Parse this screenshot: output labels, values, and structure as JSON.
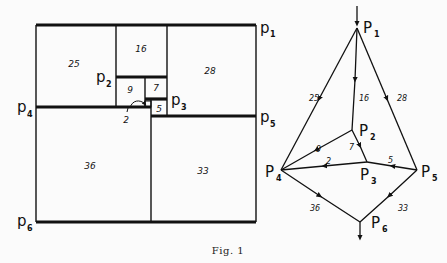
{
  "figure": {
    "caption": "Fig. 1"
  },
  "rectangle_dissection": {
    "squares": [
      {
        "id": "sq25",
        "label": "25"
      },
      {
        "id": "sq16",
        "label": "16"
      },
      {
        "id": "sq28",
        "label": "28"
      },
      {
        "id": "sq9",
        "label": "9"
      },
      {
        "id": "sq7",
        "label": "7"
      },
      {
        "id": "sq5",
        "label": "5"
      },
      {
        "id": "sq2",
        "label": "2"
      },
      {
        "id": "sq36",
        "label": "36"
      },
      {
        "id": "sq33",
        "label": "33"
      }
    ],
    "terminals": [
      {
        "id": "p1",
        "base": "p",
        "sub": "1"
      },
      {
        "id": "p2",
        "base": "p",
        "sub": "2"
      },
      {
        "id": "p3",
        "base": "p",
        "sub": "3"
      },
      {
        "id": "p4",
        "base": "p",
        "sub": "4"
      },
      {
        "id": "p5",
        "base": "p",
        "sub": "5"
      },
      {
        "id": "p6",
        "base": "p",
        "sub": "6"
      }
    ]
  },
  "network_graph": {
    "nodes": [
      {
        "id": "P1",
        "base": "P",
        "sub": "1"
      },
      {
        "id": "P2",
        "base": "P",
        "sub": "2"
      },
      {
        "id": "P3",
        "base": "P",
        "sub": "3"
      },
      {
        "id": "P4",
        "base": "P",
        "sub": "4"
      },
      {
        "id": "P5",
        "base": "P",
        "sub": "5"
      },
      {
        "id": "P6",
        "base": "P",
        "sub": "6"
      }
    ],
    "edges": [
      {
        "from": "P1",
        "to": "P4",
        "label": "25"
      },
      {
        "from": "P1",
        "to": "P2",
        "label": "16"
      },
      {
        "from": "P1",
        "to": "P5",
        "label": "28"
      },
      {
        "from": "P2",
        "to": "P4",
        "label": "9"
      },
      {
        "from": "P2",
        "to": "P3",
        "label": "7"
      },
      {
        "from": "P3",
        "to": "P4",
        "label": "2"
      },
      {
        "from": "P5",
        "to": "P3",
        "label": "5"
      },
      {
        "from": "P4",
        "to": "P6",
        "label": "36"
      },
      {
        "from": "P5",
        "to": "P6",
        "label": "33"
      }
    ]
  }
}
